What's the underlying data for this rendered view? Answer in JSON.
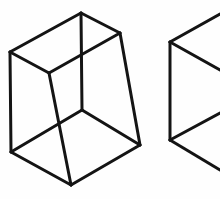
{
  "page": {
    "background_color": "#fefefe",
    "width": 220,
    "height": 199
  },
  "style": {
    "stroke_color": "#141414",
    "stroke_width": 3,
    "fill": "none",
    "watermark_color": "#f2f1ef"
  },
  "figures": [
    {
      "name": "frustum-left",
      "label": "Left truncated pyramid wireframe",
      "clipped": false,
      "vertices": {
        "top_back_apex": [
          81,
          13
        ],
        "top_left": [
          10,
          52
        ],
        "top_right": [
          120,
          33
        ],
        "top_front_inner": [
          49,
          73
        ],
        "bottom_left": [
          11,
          152
        ],
        "bottom_front": [
          71,
          185
        ],
        "bottom_right": [
          140,
          145
        ],
        "bottom_inner": [
          82,
          110
        ]
      },
      "edges": [
        [
          "top_left",
          "top_back_apex"
        ],
        [
          "top_back_apex",
          "top_right"
        ],
        [
          "top_right",
          "top_front_inner"
        ],
        [
          "top_front_inner",
          "top_left"
        ],
        [
          "top_left",
          "bottom_left"
        ],
        [
          "top_right",
          "bottom_right"
        ],
        [
          "top_front_inner",
          "bottom_front"
        ],
        [
          "bottom_left",
          "bottom_inner"
        ],
        [
          "bottom_inner",
          "bottom_right"
        ],
        [
          "bottom_left",
          "bottom_front"
        ],
        [
          "bottom_front",
          "bottom_right"
        ],
        [
          "top_back_apex",
          "bottom_inner"
        ]
      ]
    },
    {
      "name": "frustum-right",
      "label": "Right truncated pyramid wireframe (cropped at image edge)",
      "clipped": true,
      "vertices": {
        "top_left": [
          170,
          42
        ],
        "bottom_left": [
          170,
          140
        ],
        "top_edge_exit": [
          220,
          14
        ],
        "mid_upper_exit": [
          220,
          70
        ],
        "mid_lower_exit": [
          220,
          113
        ],
        "bottom_edge_exit": [
          220,
          170
        ]
      },
      "edges": [
        [
          "top_left",
          "top_edge_exit"
        ],
        [
          "top_left",
          "mid_upper_exit"
        ],
        [
          "top_left",
          "bottom_left"
        ],
        [
          "bottom_left",
          "mid_lower_exit"
        ],
        [
          "bottom_left",
          "bottom_edge_exit"
        ]
      ]
    }
  ],
  "watermarks": [
    {
      "text": "",
      "x": 30,
      "y": 40
    },
    {
      "text": "",
      "x": 150,
      "y": 75
    },
    {
      "text": "",
      "x": 60,
      "y": 130
    },
    {
      "text": "",
      "x": 170,
      "y": 185
    }
  ]
}
